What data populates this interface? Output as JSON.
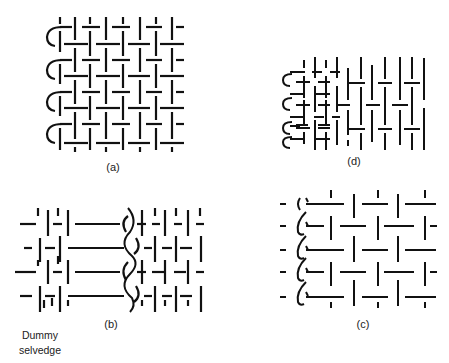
{
  "figure": {
    "ink_color": "#111111",
    "background": "#ffffff"
  },
  "panels": [
    {
      "id": "a",
      "label": "(a)",
      "description": "Plain weave with tuck-in (loop) selvedge on left"
    },
    {
      "id": "b",
      "label": "(b)",
      "description": "Plain weave with leno selvedge and dummy selvedge, long floats"
    },
    {
      "id": "c",
      "label": "(c)",
      "description": "Weave with leno twisted selvedge on left edge"
    },
    {
      "id": "d",
      "label": "(d)",
      "description": "Tucked-in selvedge with varying weave density"
    }
  ],
  "annotations": {
    "dummy_selvedge": "Dummy selvedge"
  }
}
